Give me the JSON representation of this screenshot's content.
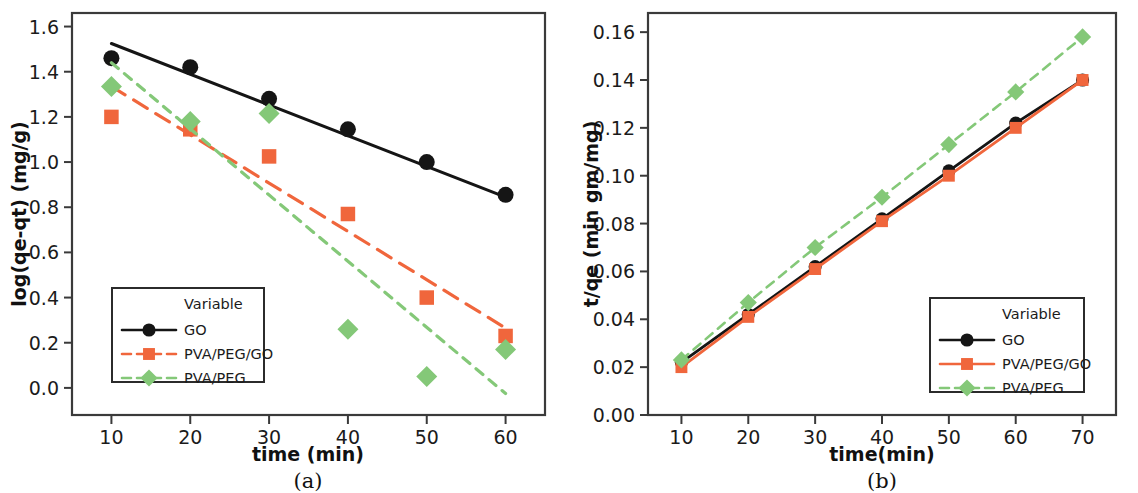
{
  "figure": {
    "background": "#ffffff",
    "panels": [
      "(a)",
      "(b)"
    ]
  },
  "colors": {
    "go": "#151515",
    "pva_peg_go": "#F0663C",
    "pva_peg": "#84C878",
    "frame": "#3a3a3a",
    "text": "#1b1b1b"
  },
  "panel_a": {
    "caption": "(a)",
    "xlabel": "time (min)",
    "ylabel": "log(qe-qt) (mg/g)",
    "legend": {
      "title": "Variable",
      "items": [
        {
          "label": "GO",
          "marker": "circle",
          "line": "solid",
          "color": "#151515"
        },
        {
          "label": "PVA/PEG/GO",
          "marker": "square",
          "line": "dashed",
          "color": "#F0663C"
        },
        {
          "label": "PVA/PEG",
          "marker": "diamond",
          "line": "dashed",
          "color": "#84C878"
        }
      ]
    },
    "xticks": [
      "10",
      "20",
      "30",
      "40",
      "50",
      "60"
    ],
    "yticks": [
      "0.0",
      "0.2",
      "0.4",
      "0.6",
      "0.8",
      "1.0",
      "1.2",
      "1.4",
      "1.6"
    ]
  },
  "panel_b": {
    "caption": "(b)",
    "xlabel": "time(min)",
    "ylabel": "t/qe (min gm/mg)",
    "legend": {
      "title": "Variable",
      "items": [
        {
          "label": "GO",
          "marker": "circle",
          "line": "solid",
          "color": "#151515"
        },
        {
          "label": "PVA/PEG/GO",
          "marker": "square",
          "line": "solid",
          "color": "#F0663C"
        },
        {
          "label": "PVA/PEG",
          "marker": "diamond",
          "line": "dashed",
          "color": "#84C878"
        }
      ]
    },
    "xticks": [
      "10",
      "20",
      "30",
      "40",
      "50",
      "60",
      "70"
    ],
    "yticks": [
      "0.00",
      "0.02",
      "0.04",
      "0.06",
      "0.08",
      "0.10",
      "0.12",
      "0.14",
      "0.16"
    ]
  },
  "chart_data": [
    {
      "id": "panel_a",
      "type": "scatter",
      "title": "(a)",
      "xlabel": "time (min)",
      "ylabel": "log(qe-qt) (mg/g)",
      "xlim": [
        5,
        65
      ],
      "ylim": [
        -0.12,
        1.66
      ],
      "grid": false,
      "legend_position": "lower-left",
      "x": [
        10,
        20,
        30,
        40,
        50,
        60
      ],
      "series": [
        {
          "name": "GO",
          "marker": "circle",
          "color": "#151515",
          "line": "solid",
          "values": [
            1.46,
            1.42,
            1.28,
            1.145,
            1.0,
            0.855
          ],
          "trendline": {
            "x": [
              10,
              60
            ],
            "y": [
              1.525,
              0.845
            ]
          }
        },
        {
          "name": "PVA/PEG/GO",
          "marker": "square",
          "color": "#F0663C",
          "line": "dashed",
          "values": [
            1.2,
            1.145,
            1.025,
            0.77,
            0.4,
            0.23
          ],
          "trendline": {
            "x": [
              10,
              60
            ],
            "y": [
              1.335,
              0.265
            ]
          }
        },
        {
          "name": "PVA/PEG",
          "marker": "diamond",
          "color": "#84C878",
          "line": "dashed",
          "values": [
            1.335,
            1.18,
            1.215,
            0.26,
            0.05,
            0.17
          ],
          "trendline": {
            "x": [
              10,
              60
            ],
            "y": [
              1.44,
              -0.025
            ]
          }
        }
      ]
    },
    {
      "id": "panel_b",
      "type": "line",
      "title": "(b)",
      "xlabel": "time(min)",
      "ylabel": "t/qe (min gm/mg)",
      "xlim": [
        5,
        75
      ],
      "ylim": [
        0.0,
        0.168
      ],
      "grid": false,
      "legend_position": "lower-right",
      "x": [
        10,
        20,
        30,
        40,
        50,
        60,
        70
      ],
      "series": [
        {
          "name": "GO",
          "marker": "circle",
          "color": "#151515",
          "line": "solid",
          "values": [
            0.022,
            0.042,
            0.062,
            0.082,
            0.102,
            0.122,
            0.14
          ]
        },
        {
          "name": "PVA/PEG/GO",
          "marker": "square",
          "color": "#F0663C",
          "line": "solid",
          "values": [
            0.02,
            0.041,
            0.061,
            0.081,
            0.1,
            0.12,
            0.14
          ]
        },
        {
          "name": "PVA/PEG",
          "marker": "diamond",
          "color": "#84C878",
          "line": "dashed",
          "values": [
            0.023,
            0.047,
            0.07,
            0.091,
            0.113,
            0.135,
            0.158
          ]
        }
      ]
    }
  ]
}
